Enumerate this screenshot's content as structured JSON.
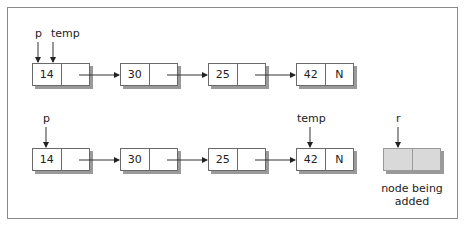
{
  "diagram": {
    "type": "linked-list",
    "row1": {
      "pointers": [
        {
          "name": "p",
          "target_node": 0
        },
        {
          "name": "temp",
          "target_node": 0
        }
      ],
      "nodes": [
        {
          "data": "14",
          "next": ""
        },
        {
          "data": "30",
          "next": ""
        },
        {
          "data": "25",
          "next": ""
        },
        {
          "data": "42",
          "next": "N"
        }
      ]
    },
    "row2": {
      "pointers": [
        {
          "name": "p",
          "target_node": 0
        },
        {
          "name": "temp",
          "target_node": 3
        }
      ],
      "nodes": [
        {
          "data": "14",
          "next": ""
        },
        {
          "data": "30",
          "next": ""
        },
        {
          "data": "25",
          "next": ""
        },
        {
          "data": "42",
          "next": "N"
        }
      ],
      "new_node": {
        "pointer": "r",
        "data": "",
        "next": "",
        "caption_line1": "node being",
        "caption_line2": "added",
        "fill": "#d9d9d9"
      }
    }
  }
}
